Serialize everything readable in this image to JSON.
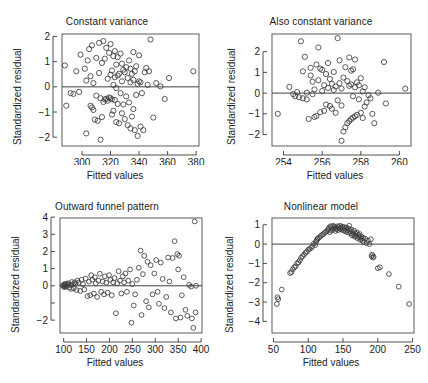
{
  "figure": {
    "background": "#ffffff",
    "point_color": "#3d3d3d",
    "axis_color": "#3a3a3a",
    "text_color": "#1c1c1c"
  },
  "chart_data": [
    {
      "id": "constant-variance",
      "type": "scatter",
      "title": "Constant variance",
      "xlabel": "Fitted values",
      "ylabel": "Standardized residual",
      "xlim": [
        286,
        382
      ],
      "ylim": [
        -2.35,
        2.1
      ],
      "xticks": [
        300,
        320,
        340,
        360,
        380
      ],
      "yticks": [
        -2,
        -1,
        0,
        1,
        2
      ],
      "grid": false,
      "legend": null,
      "reference_line": {
        "y": 0
      },
      "x": [
        288,
        289,
        292,
        294,
        296,
        298,
        299,
        302,
        303,
        303,
        304,
        305,
        306,
        306,
        307,
        307,
        308,
        308,
        309,
        310,
        310,
        311,
        312,
        312,
        313,
        313,
        314,
        314,
        315,
        315,
        316,
        316,
        317,
        317,
        318,
        318,
        319,
        319,
        320,
        320,
        320,
        321,
        321,
        321,
        322,
        322,
        322,
        323,
        323,
        323,
        324,
        324,
        324,
        325,
        325,
        325,
        326,
        326,
        327,
        327,
        328,
        328,
        328,
        329,
        329,
        330,
        330,
        331,
        331,
        332,
        332,
        333,
        333,
        334,
        334,
        334,
        335,
        335,
        336,
        336,
        336,
        337,
        337,
        338,
        338,
        339,
        339,
        340,
        340,
        341,
        341,
        342,
        343,
        344,
        345,
        346,
        347,
        348,
        350,
        352,
        355,
        358,
        361,
        378
      ],
      "y": [
        0.85,
        -0.75,
        -0.25,
        -0.28,
        0.62,
        -0.2,
        1.28,
        0.72,
        -1.85,
        0.25,
        1.05,
        1.5,
        -0.75,
        0.42,
        -0.82,
        1.65,
        -0.92,
        0.15,
        -1.3,
        -0.35,
        1.15,
        -1.35,
        0.55,
        1.75,
        -2.1,
        -0.45,
        -1.2,
        0.95,
        -0.6,
        1.82,
        -0.5,
        1.12,
        -0.48,
        1.55,
        -0.55,
        0.32,
        -0.42,
        1.35,
        -0.45,
        0.48,
        1.7,
        -1.1,
        -0.5,
        0.65,
        -0.95,
        0.08,
        1.22,
        -0.52,
        0.38,
        1.42,
        -1.4,
        -0.05,
        0.88,
        -0.68,
        0.45,
        1.18,
        -1.45,
        0.52,
        -0.25,
        1.32,
        -1.05,
        0.22,
        0.92,
        -0.7,
        0.68,
        -1.28,
        0.58,
        -0.38,
        0.78,
        -1.52,
        0.35,
        -0.62,
        1.05,
        -1.65,
        0.18,
        0.72,
        -1.18,
        0.52,
        -0.88,
        0.28,
        1.38,
        -1.72,
        0.62,
        -0.32,
        0.82,
        -1.95,
        0.12,
        0.22,
        1.25,
        -1.58,
        0.18,
        -0.25,
        -1.72,
        0.58,
        0.75,
        0.08,
        0.62,
        1.88,
        -1.22,
        0.15,
        0.02,
        -0.48,
        0.35,
        0.62
      ]
    },
    {
      "id": "also-constant-variance",
      "type": "scatter",
      "title": "Also constant variance",
      "xlabel": "Fitted values",
      "ylabel": "Standardized residual",
      "xlim": [
        253.4,
        260.6
      ],
      "ylim": [
        -2.55,
        2.85
      ],
      "xticks": [
        254,
        256,
        258,
        260
      ],
      "yticks": [
        -2,
        -1,
        0,
        1,
        2
      ],
      "grid": false,
      "legend": null,
      "reference_line": {
        "y": 0
      },
      "x": [
        253.7,
        254.3,
        254.5,
        254.6,
        254.7,
        254.8,
        254.9,
        255.0,
        255.0,
        255.1,
        255.2,
        255.2,
        255.3,
        255.4,
        255.4,
        255.5,
        255.5,
        255.6,
        255.6,
        255.7,
        255.7,
        255.8,
        255.8,
        255.9,
        255.9,
        256.0,
        256.0,
        256.1,
        256.1,
        256.2,
        256.2,
        256.3,
        256.3,
        256.4,
        256.4,
        256.5,
        256.5,
        256.6,
        256.6,
        256.7,
        256.7,
        256.8,
        256.8,
        256.9,
        256.9,
        257.0,
        257.0,
        257.0,
        257.1,
        257.1,
        257.2,
        257.2,
        257.3,
        257.3,
        257.4,
        257.4,
        257.4,
        257.5,
        257.5,
        257.5,
        257.6,
        257.6,
        257.6,
        257.7,
        257.7,
        257.7,
        257.8,
        257.8,
        257.9,
        257.9,
        258.0,
        258.0,
        258.1,
        258.1,
        258.2,
        258.2,
        258.3,
        258.4,
        258.5,
        258.6,
        258.7,
        258.9,
        259.2,
        259.3,
        260.3
      ],
      "y": [
        -1.0,
        0.3,
        -0.05,
        -0.15,
        0.05,
        -0.2,
        2.5,
        -0.25,
        1.05,
        1.75,
        -0.3,
        0.02,
        -1.25,
        0.85,
        1.22,
        0.55,
        -0.05,
        -1.15,
        0.18,
        1.38,
        -1.1,
        0.62,
        2.2,
        -0.92,
        1.18,
        0.1,
        1.12,
        -0.85,
        0.38,
        0.92,
        -0.55,
        0.25,
        1.45,
        -0.62,
        0.68,
        -0.75,
        0.45,
        0.15,
        1.02,
        -0.95,
        0.32,
        2.65,
        -0.35,
        0.48,
        1.58,
        -2.3,
        -0.6,
        0.22,
        -1.85,
        0.75,
        -1.65,
        1.25,
        -1.45,
        0.58,
        -1.35,
        0.35,
        1.72,
        -1.25,
        0.42,
        1.08,
        -1.18,
        -0.15,
        1.15,
        -1.12,
        0.28,
        1.62,
        -1.05,
        0.52,
        -0.3,
        0.38,
        -0.95,
        0.72,
        -1.2,
        0.08,
        -0.65,
        0.28,
        -0.45,
        -0.1,
        -0.25,
        -1.0,
        -1.45,
        0.02,
        1.5,
        -0.5,
        0.22
      ]
    },
    {
      "id": "outward-funnel-pattern",
      "type": "scatter",
      "title": "Outward funnel pattern",
      "xlabel": "Fitted values",
      "ylabel": "Standardized residual",
      "xlim": [
        92,
        402
      ],
      "ylim": [
        -2.75,
        3.95
      ],
      "xticks": [
        100,
        150,
        200,
        250,
        300,
        350,
        400
      ],
      "yticks": [
        -2,
        -1,
        0,
        1,
        2,
        3,
        4
      ],
      "ytick_labels": [
        "-2",
        "",
        "0",
        "1",
        "2",
        "3",
        "4"
      ],
      "grid": false,
      "legend": null,
      "reference_line": {
        "y": 0
      },
      "x": [
        98,
        100,
        101,
        102,
        103,
        104,
        105,
        106,
        108,
        110,
        112,
        114,
        116,
        118,
        120,
        122,
        124,
        126,
        128,
        130,
        133,
        136,
        139,
        142,
        145,
        148,
        152,
        155,
        158,
        160,
        163,
        166,
        168,
        170,
        173,
        176,
        179,
        182,
        185,
        188,
        190,
        193,
        196,
        199,
        202,
        205,
        208,
        211,
        214,
        217,
        220,
        223,
        226,
        229,
        232,
        235,
        238,
        241,
        245,
        248,
        250,
        253,
        256,
        260,
        264,
        268,
        270,
        273,
        276,
        280,
        283,
        286,
        290,
        294,
        298,
        302,
        305,
        308,
        312,
        316,
        320,
        324,
        328,
        331,
        334,
        338,
        342,
        345,
        348,
        350,
        352,
        355,
        358,
        362,
        366,
        370,
        374,
        378,
        380,
        383,
        386,
        388,
        389,
        390
      ],
      "y": [
        0.02,
        -0.05,
        0.08,
        0.0,
        -0.08,
        0.12,
        0.05,
        -0.02,
        0.1,
        0.15,
        -0.1,
        0.05,
        -0.18,
        0.22,
        0.08,
        -0.15,
        0.2,
        0.12,
        -0.25,
        0.3,
        0.18,
        -0.3,
        0.35,
        0.1,
        -0.22,
        0.42,
        -0.6,
        0.25,
        -0.55,
        0.62,
        0.35,
        -0.45,
        0.5,
        0.15,
        -0.65,
        0.3,
        0.7,
        -0.35,
        0.25,
        -0.5,
        0.55,
        0.18,
        -0.4,
        0.62,
        0.35,
        -0.55,
        0.2,
        0.45,
        -1.6,
        0.15,
        0.85,
        0.3,
        -0.45,
        0.55,
        0.2,
        0.72,
        -0.35,
        0.3,
        0.95,
        -2.15,
        0.1,
        -1.15,
        -0.5,
        0.35,
        1.05,
        2.05,
        -1.7,
        0.68,
        1.75,
        -0.9,
        1.4,
        -1.25,
        1.2,
        -0.5,
        0.72,
        1.5,
        -0.35,
        -1.05,
        1.35,
        0.4,
        -1.3,
        -0.65,
        1.65,
        0.25,
        -1.55,
        1.62,
        2.6,
        -1.9,
        1.85,
        0.95,
        1.75,
        -1.85,
        -0.55,
        0.5,
        -1.4,
        -1.75,
        0.05,
        -0.05,
        -1.9,
        -2.45,
        3.75,
        -1.55,
        0.0
      ]
    },
    {
      "id": "nonlinear-model",
      "type": "scatter",
      "title": "Nonlinear model",
      "xlabel": "Fitted values",
      "ylabel": "Standardized residual",
      "xlim": [
        48,
        252
      ],
      "ylim": [
        -4.6,
        1.35
      ],
      "xticks": [
        50,
        100,
        150,
        200,
        250
      ],
      "yticks": [
        -4,
        -3,
        -2,
        -1,
        0,
        1
      ],
      "grid": false,
      "legend": null,
      "reference_line": {
        "y": 0
      },
      "x": [
        55,
        56,
        57,
        62,
        74,
        76,
        78,
        80,
        82,
        84,
        86,
        88,
        90,
        92,
        94,
        96,
        98,
        100,
        102,
        104,
        106,
        108,
        110,
        111,
        112,
        113,
        114,
        116,
        118,
        120,
        122,
        124,
        126,
        128,
        129,
        130,
        131,
        132,
        133,
        134,
        135,
        136,
        137,
        138,
        139,
        140,
        141,
        142,
        143,
        144,
        145,
        146,
        147,
        148,
        149,
        150,
        151,
        152,
        153,
        154,
        155,
        156,
        157,
        158,
        159,
        160,
        161,
        162,
        163,
        164,
        165,
        166,
        167,
        168,
        169,
        170,
        171,
        172,
        173,
        174,
        175,
        176,
        177,
        178,
        179,
        180,
        182,
        184,
        186,
        188,
        190,
        191,
        192,
        193,
        194,
        200,
        203,
        216,
        230,
        245
      ],
      "y": [
        -3.1,
        -2.75,
        -2.85,
        -2.35,
        -1.5,
        -1.45,
        -1.3,
        -1.2,
        -1.15,
        -1.0,
        -0.95,
        -0.85,
        -0.7,
        -0.62,
        -0.55,
        -0.45,
        -0.4,
        -0.3,
        -0.25,
        -0.2,
        -0.12,
        0.02,
        -0.05,
        0.12,
        0.18,
        0.25,
        0.3,
        0.35,
        0.42,
        0.48,
        0.52,
        0.6,
        0.65,
        0.72,
        0.78,
        0.85,
        0.62,
        0.92,
        0.7,
        0.88,
        0.75,
        0.95,
        0.8,
        0.9,
        0.68,
        0.85,
        0.78,
        0.92,
        0.72,
        0.88,
        0.8,
        0.95,
        0.85,
        0.75,
        0.9,
        0.82,
        0.7,
        0.88,
        0.78,
        0.65,
        0.85,
        0.72,
        0.6,
        0.8,
        0.95,
        0.68,
        0.55,
        0.75,
        0.45,
        0.62,
        0.5,
        0.7,
        0.38,
        0.55,
        0.42,
        0.6,
        0.3,
        0.48,
        0.35,
        0.52,
        0.22,
        0.4,
        0.28,
        0.18,
        0.32,
        0.1,
        0.28,
        0.05,
        0.18,
        0.0,
        0.25,
        -0.62,
        -0.55,
        -0.7,
        -0.65,
        -1.25,
        -1.2,
        -1.55,
        -2.2,
        -3.1,
        -4.3
      ]
    }
  ]
}
